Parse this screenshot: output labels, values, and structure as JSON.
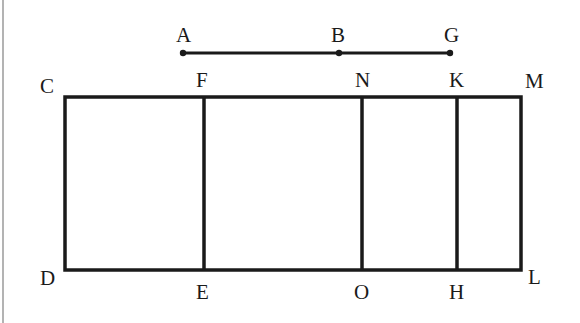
{
  "figure": {
    "type": "geometry-diagram",
    "segment": {
      "points": [
        {
          "label": "A",
          "x": 183,
          "y": 53
        },
        {
          "label": "B",
          "x": 339,
          "y": 53
        },
        {
          "label": "G",
          "x": 450,
          "y": 53
        }
      ]
    },
    "rectangle": {
      "corners": {
        "C": [
          65,
          97
        ],
        "M": [
          521,
          97
        ],
        "L": [
          521,
          270
        ],
        "D": [
          65,
          270
        ]
      },
      "dividers": [
        {
          "top": "F",
          "bottom": "E",
          "x": 204
        },
        {
          "top": "N",
          "bottom": "O",
          "x": 362
        },
        {
          "top": "K",
          "bottom": "H",
          "x": 457
        }
      ]
    },
    "labels": {
      "A": "A",
      "B": "B",
      "G": "G",
      "C": "C",
      "F": "F",
      "N": "N",
      "K": "K",
      "M": "M",
      "D": "D",
      "E": "E",
      "O": "O",
      "H": "H",
      "L": "L"
    }
  }
}
